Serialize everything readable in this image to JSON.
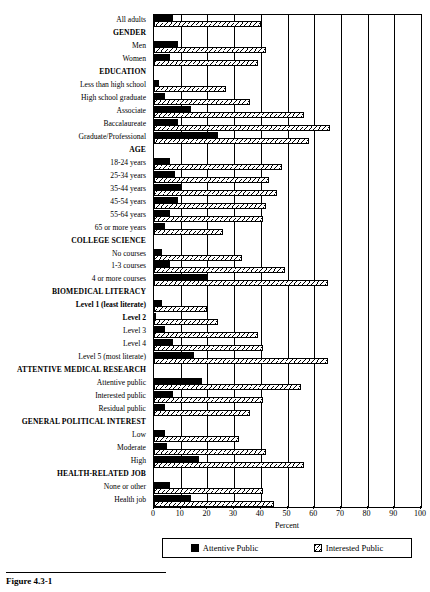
{
  "figure": {
    "caption": "Figure 4.3-1",
    "xlabel": "Percent"
  },
  "legend": {
    "items": [
      {
        "label": "Attentive Public",
        "key": "attentive",
        "color": "#000000"
      },
      {
        "label": "Interested Public",
        "key": "interested",
        "color": "#d8d8d8"
      }
    ]
  },
  "axis": {
    "ticks": [
      0,
      10,
      20,
      30,
      40,
      50,
      60,
      70,
      80,
      90,
      100
    ],
    "min": 0,
    "max": 100
  },
  "chart_data": {
    "type": "bar",
    "orientation": "horizontal",
    "title": "",
    "xlabel": "Percent",
    "ylabel": "",
    "xlim": [
      0,
      100
    ],
    "grid": true,
    "legend_position": "bottom",
    "series": [
      {
        "name": "Attentive Public",
        "key": "attentive"
      },
      {
        "name": "Interested Public",
        "key": "interested"
      }
    ],
    "rows": [
      {
        "label": "All adults",
        "type": "item",
        "attentive": 7,
        "interested": 40
      },
      {
        "label": "GENDER",
        "type": "group"
      },
      {
        "label": "Men",
        "type": "item",
        "attentive": 9,
        "interested": 42
      },
      {
        "label": "Women",
        "type": "item",
        "attentive": 6,
        "interested": 39
      },
      {
        "label": "EDUCATION",
        "type": "group"
      },
      {
        "label": "Less than high school",
        "type": "item",
        "attentive": 2,
        "interested": 27
      },
      {
        "label": "High school graduate",
        "type": "item",
        "attentive": 4,
        "interested": 36
      },
      {
        "label": "Associate",
        "type": "item",
        "attentive": 14,
        "interested": 56
      },
      {
        "label": "Baccalaureate",
        "type": "item",
        "attentive": 9,
        "interested": 66
      },
      {
        "label": "Graduate/Professional",
        "type": "item",
        "attentive": 24,
        "interested": 58
      },
      {
        "label": "AGE",
        "type": "group"
      },
      {
        "label": "18-24 years",
        "type": "item",
        "attentive": 6,
        "interested": 48
      },
      {
        "label": "25-34 years",
        "type": "item",
        "attentive": 8,
        "interested": 43
      },
      {
        "label": "35-44 years",
        "type": "item",
        "attentive": 10,
        "interested": 46
      },
      {
        "label": "45-54 years",
        "type": "item",
        "attentive": 9,
        "interested": 42
      },
      {
        "label": "55-64 years",
        "type": "item",
        "attentive": 6,
        "interested": 41
      },
      {
        "label": "65 or more years",
        "type": "item",
        "attentive": 4,
        "interested": 26
      },
      {
        "label": "COLLEGE SCIENCE",
        "type": "group"
      },
      {
        "label": "No courses",
        "type": "item",
        "attentive": 3,
        "interested": 33
      },
      {
        "label": "1-3 courses",
        "type": "item",
        "attentive": 6,
        "interested": 49
      },
      {
        "label": "4 or more courses",
        "type": "item",
        "attentive": 20,
        "interested": 65
      },
      {
        "label": "BIOMEDICAL LITERACY",
        "type": "group"
      },
      {
        "label": "Level 1 (least literate)",
        "type": "item-bold",
        "attentive": 3,
        "interested": 20
      },
      {
        "label": "Level 2",
        "type": "item-bold",
        "attentive": 0,
        "interested": 24
      },
      {
        "label": "Level 3",
        "type": "item",
        "attentive": 4,
        "interested": 39
      },
      {
        "label": "Level 4",
        "type": "item",
        "attentive": 7,
        "interested": 41
      },
      {
        "label": "Level 5 (most literate)",
        "type": "item",
        "attentive": 15,
        "interested": 65
      },
      {
        "label": "ATTENTIVE MEDICAL RESEARCH",
        "type": "group"
      },
      {
        "label": "Attentive public",
        "type": "item",
        "attentive": 18,
        "interested": 55
      },
      {
        "label": "Interested public",
        "type": "item",
        "attentive": 7,
        "interested": 41
      },
      {
        "label": "Residual public",
        "type": "item",
        "attentive": 4,
        "interested": 36
      },
      {
        "label": "GENERAL POLITICAL INTEREST",
        "type": "group"
      },
      {
        "label": "Low",
        "type": "item",
        "attentive": 4,
        "interested": 32
      },
      {
        "label": "Moderate",
        "type": "item",
        "attentive": 5,
        "interested": 42
      },
      {
        "label": "High",
        "type": "item",
        "attentive": 17,
        "interested": 56
      },
      {
        "label": "HEALTH-RELATED JOB",
        "type": "group"
      },
      {
        "label": "None or other",
        "type": "item",
        "attentive": 6,
        "interested": 41
      },
      {
        "label": "Health job",
        "type": "item",
        "attentive": 14,
        "interested": 45
      }
    ]
  }
}
